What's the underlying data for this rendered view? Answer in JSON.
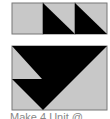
{
  "diagram": {
    "colors": {
      "fill_light": "#c8c8c8",
      "fill_dark": "#000000",
      "border": "#777777"
    },
    "top_row": {
      "units": [
        "plain",
        "half-square-triangle",
        "half-square-triangle"
      ]
    },
    "bottom_block": {
      "description": "flying-geese style block with black triangle shapes"
    },
    "caption": "Make 4 Unit @"
  }
}
